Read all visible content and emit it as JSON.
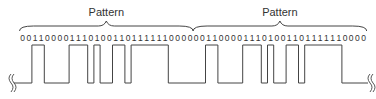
{
  "diagram": {
    "patterns": [
      {
        "label": "Pattern",
        "bits": "0011000011101001101111110000"
      },
      {
        "label": "Pattern",
        "bits": "0011000011101001101111110000"
      }
    ],
    "bit_sequence": "00110000111010011011111100000011000011101001101111110000",
    "waveform": {
      "type": "NRZ",
      "high_means": "1",
      "low_means": "0",
      "break_marks": [
        "left",
        "right"
      ]
    },
    "colors": {
      "stroke": "#444444",
      "text": "#333333",
      "background": "#ffffff"
    }
  }
}
